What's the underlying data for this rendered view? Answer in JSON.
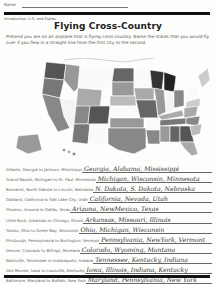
{
  "header": {
    "name_label": "Name",
    "section": "Introduction: U.S. and States",
    "title": "Flying Cross-Country",
    "instructions": "Pretend you are on an airplane that is flying cross-country. Name the states that you would fly over if you flew in a straight line from the first city to the second."
  },
  "map": {
    "description": "Map of the United States with states shaded in gray tones",
    "icon": "us-map"
  },
  "routes": [
    {
      "question": "Atlanta, Georgia to Jackson, Mississippi",
      "answer": "Georgia, Alabama, Mississippi"
    },
    {
      "question": "Grand Rapids, Michigan to St. Paul, Minnesota",
      "answer": "Michigan, Wisconsin, Minnesota"
    },
    {
      "question": "Bismarck, North Dakota to Lincoln, Nebraska",
      "answer": "N. Dakota, S. Dakota, Nebraska"
    },
    {
      "question": "Oakland, California to Salt Lake City, Utah",
      "answer": "California, Nevada, Utah"
    },
    {
      "question": "Phoenix, Arizona to Dallas, Texas",
      "answer": "Arizona, NewMexico, Texas"
    },
    {
      "question": "Little Rock, Arkansas to Chicago, Illinois",
      "answer": "Arkansas, Missouri, Illinois"
    },
    {
      "question": "Toledo, Ohio to Green Bay, Wisconsin",
      "answer": "Ohio, Michigan, Wisconsin"
    },
    {
      "question": "Pittsburgh, Pennsylvania to Burlington, Vermont",
      "answer": "Pennsylvania, NewYork, Vermont"
    },
    {
      "question": "Denver, Colorado to Billings, Montana",
      "answer": "Colorado, Wyoming, Montana"
    },
    {
      "question": "Nashville, Tennessee to Indianapolis, Indiana",
      "answer": "Tennessee, Kentucky, Indiana"
    },
    {
      "question": "Des Moines, Iowa to Louisville, Kentucky",
      "answer": "Iowa, Illinois, Indiana, Kentucky"
    },
    {
      "question": "Baltimore, Maryland to Buffalo, New York",
      "answer": "Maryland, Pennsylvania, New York"
    }
  ]
}
